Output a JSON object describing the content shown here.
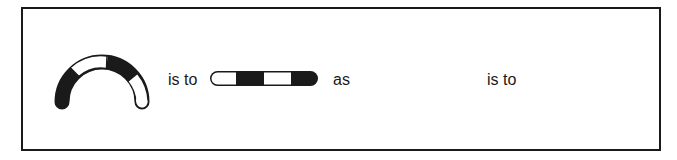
{
  "analogy": {
    "term1": {
      "shape": "arc",
      "segments": [
        "black",
        "white",
        "black",
        "white"
      ]
    },
    "connector1": "is to",
    "term2": {
      "shape": "horizontal-bar",
      "segments": [
        "white",
        "black",
        "white",
        "black"
      ]
    },
    "connector2": "as",
    "term3": {
      "shape": "blank"
    },
    "connector3": "is to",
    "term4": {
      "shape": "blank"
    }
  },
  "colors": {
    "ink": "#1a1a1a",
    "paper": "#ffffff"
  }
}
